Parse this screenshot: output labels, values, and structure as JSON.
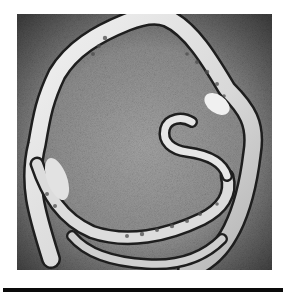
{
  "figure": {
    "mode": "grayscale",
    "colors": {
      "background": "#8c8c8c",
      "background_dark": "#4a4a4a",
      "specimen_light": "#e8e8e8",
      "specimen_mid": "#bdbdbd",
      "specimen_outline": "#1e1e1e",
      "segment_spots": "#4d4d4d",
      "rule": "#0a0a0a",
      "page": "#ffffff"
    }
  },
  "rule": {
    "visible": true
  }
}
